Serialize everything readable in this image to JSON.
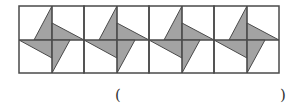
{
  "figure": {
    "type": "pinwheel-tile-row",
    "tile_count": 4,
    "tile_size": 65,
    "origin": {
      "x": 19,
      "y": 6
    },
    "height": 67,
    "center_y": 40,
    "fill_color": "#a3a3a3",
    "line_color": "#4a4a4a",
    "background": "#ffffff"
  },
  "answer": {
    "open_paren": "(",
    "close_paren": ")",
    "blank": ""
  }
}
